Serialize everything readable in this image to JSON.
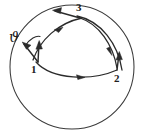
{
  "figure": {
    "background_color": "#ffffff",
    "ink_color": "#2b2b2b",
    "width": 145,
    "height": 137
  },
  "sphere": {
    "name": "sphere-outline",
    "center_x": 72,
    "center_y": 67,
    "radius": 62,
    "stroke_color": "#3a3a3a"
  },
  "points": [
    {
      "id": "p1",
      "label": "1",
      "x": 36,
      "y": 62,
      "label_x": 31,
      "label_y": 64
    },
    {
      "id": "p2",
      "label": "2",
      "x": 117,
      "y": 73,
      "label_x": 114,
      "label_y": 73
    },
    {
      "id": "p3",
      "label": "3",
      "x": 79,
      "y": 17,
      "label_x": 76,
      "label_y": 2
    }
  ],
  "angle": {
    "name": "holonomy-angle",
    "symbol": "ϑ",
    "label_x": 9,
    "label_y": 31
  },
  "geodesics": [
    {
      "id": "arc-1-2",
      "from": "1",
      "to": "2",
      "direction": "right"
    },
    {
      "id": "arc-2-3",
      "from": "2",
      "to": "3",
      "direction": "up-left"
    },
    {
      "id": "arc-1-3",
      "from": "1",
      "to": "3",
      "direction": "up-right"
    },
    {
      "id": "arc-3-2-outer",
      "from": "3",
      "to": "2",
      "direction": "down-right"
    }
  ],
  "vectors": [
    {
      "id": "v1",
      "at_point": "1",
      "label": "transported vector at 1",
      "direction": "up"
    },
    {
      "id": "v1b",
      "at_point": "1",
      "label": "returned vector at 1",
      "direction": "up-left"
    },
    {
      "id": "v2",
      "at_point": "2",
      "label": "transported vector at 2",
      "direction": "up"
    },
    {
      "id": "v3",
      "at_point": "3",
      "label": "transported vector at 3",
      "direction": "left"
    }
  ]
}
